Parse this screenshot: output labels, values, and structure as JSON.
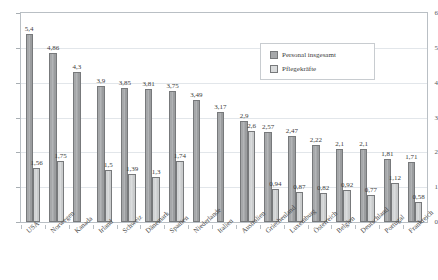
{
  "chart_data": {
    "type": "bar",
    "title": "",
    "xlabel": "",
    "ylabel": "",
    "ylim": [
      0,
      6
    ],
    "yticks": [
      "0",
      "1",
      "2",
      "3",
      "4",
      "5",
      "6"
    ],
    "grid": true,
    "legend_position": "inside-top-center",
    "decimal_separator": ",",
    "categories": [
      "USA",
      "Norwegen",
      "Kanada",
      "Irland",
      "Schweiz",
      "Dänemark",
      "Spanien",
      "Niederlande",
      "Italien",
      "Australien",
      "Griechenland",
      "Luxemburg",
      "Österreich",
      "Belgien",
      "Deutschland",
      "Portugal",
      "Frankreich"
    ],
    "series": [
      {
        "name": "Personal insgesamt",
        "color": "#a6a8aa",
        "values": [
          5.4,
          4.86,
          4.3,
          3.9,
          3.85,
          3.81,
          3.75,
          3.49,
          3.17,
          2.9,
          2.57,
          2.47,
          2.22,
          2.1,
          2.1,
          1.81,
          1.71
        ],
        "labels": [
          "5,4",
          "4,86",
          "4,3",
          "3,9",
          "3,85",
          "3,81",
          "3,75",
          "3,49",
          "3,17",
          "2,9",
          "2,57",
          "2,47",
          "2,22",
          "2,1",
          "2,1",
          "1,81",
          "1,71"
        ]
      },
      {
        "name": "Pflegekräfte",
        "color": "#d8dadb",
        "values": [
          1.56,
          1.75,
          null,
          1.5,
          1.39,
          1.3,
          1.74,
          null,
          null,
          2.6,
          0.94,
          0.87,
          0.82,
          0.92,
          0.77,
          1.12,
          0.58
        ],
        "labels": [
          "1,56",
          "1,75",
          "",
          "1,5",
          "1,39",
          "1,3",
          "1,74",
          "",
          "",
          "2,6",
          "0,94",
          "0,87",
          "0,82",
          "0,92",
          "0,77",
          "1,12",
          "0,58"
        ]
      }
    ]
  },
  "legend": {
    "items": [
      {
        "label": "Personal insgesamt"
      },
      {
        "label": "Pflegekräfte"
      }
    ]
  }
}
